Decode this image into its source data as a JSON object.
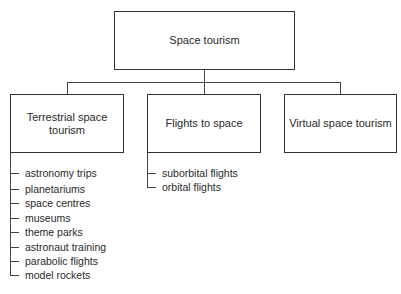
{
  "diagram": {
    "root": {
      "label": "Space tourism"
    },
    "children": [
      {
        "label": "Terrestrial space tourism",
        "items": [
          "astronomy trips",
          "planetariums",
          "space centres",
          "museums",
          "theme parks",
          "astronaut training",
          "parabolic flights",
          "model rockets"
        ]
      },
      {
        "label": "Flights to space",
        "items": [
          "suborbital flights",
          "orbital flights"
        ]
      },
      {
        "label": "Virtual space tourism",
        "items": []
      }
    ]
  }
}
